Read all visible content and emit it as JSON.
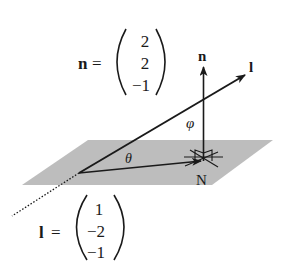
{
  "figure": {
    "type": "geometric-vector-diagram",
    "colors": {
      "plane_fill": "#bdbdbd",
      "ink": "#1a1a1a",
      "background": "#ffffff"
    }
  },
  "labels": {
    "normal_arrow": "n",
    "line_arrow": "l",
    "angle_phi": "φ",
    "angle_theta": "θ",
    "foot_point": "N"
  },
  "vectors": {
    "n": {
      "name": "n",
      "equals": "=",
      "components": [
        "2",
        "2",
        "−1"
      ]
    },
    "l": {
      "name": "l",
      "equals": "=",
      "components": [
        "1",
        "−2",
        "−1"
      ]
    }
  }
}
